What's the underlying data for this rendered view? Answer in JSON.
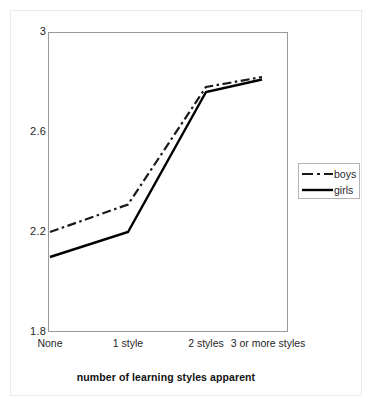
{
  "chart_data": {
    "type": "line",
    "title": "",
    "subtitle": "",
    "xlabel": "number of learning styles apparent",
    "ylabel": "",
    "categories": [
      "None",
      "1 style",
      "2 styles",
      "3 or more styles"
    ],
    "ylim": [
      1.8,
      3.0
    ],
    "yticks": [
      "1.8",
      "2.2",
      "2.6",
      "3"
    ],
    "ytick_values": [
      1.8,
      2.2,
      2.6,
      3.0
    ],
    "grid": false,
    "legend_position": "right",
    "series": [
      {
        "name": "boys",
        "style": "dash-dot",
        "color": "#1a1a1a",
        "values": [
          2.2,
          2.31,
          2.78,
          2.82
        ]
      },
      {
        "name": "girls",
        "style": "solid",
        "color": "#000000",
        "values": [
          2.1,
          2.2,
          2.76,
          2.81
        ]
      }
    ]
  },
  "legend": {
    "items": [
      {
        "label": "boys"
      },
      {
        "label": "girls"
      }
    ]
  },
  "axes": {
    "x_labels": [
      "None",
      "1 style",
      "2 styles",
      "3 or more styles"
    ],
    "y_labels": [
      "3",
      "2.6",
      "2.2",
      "1.8"
    ],
    "x_title": "number of learning styles apparent"
  },
  "colors": {
    "line": "#000000",
    "axis": "#9a9a9a",
    "frame": "#e9e9e9",
    "text": "#1f1f1f"
  }
}
